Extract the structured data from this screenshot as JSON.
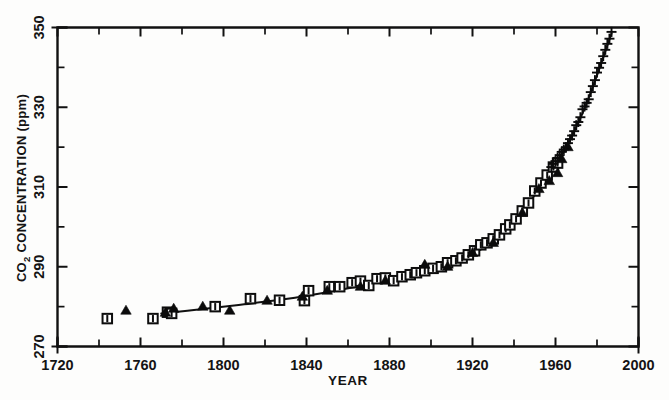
{
  "figure": {
    "background_color": "#fdfdfc",
    "ink_color": "#111111"
  },
  "axes": {
    "x_title": "YEAR",
    "y_title_main": "CO",
    "y_title_sub": "2",
    "y_title_rest": " CONCENTRATION (ppm)",
    "x_tick_labels": [
      "1720",
      "1760",
      "1800",
      "1840",
      "1880",
      "1920",
      "1960",
      "2000"
    ],
    "y_tick_labels": [
      "270",
      "290",
      "310",
      "330",
      "350"
    ]
  },
  "chart_data": {
    "type": "scatter",
    "title": "",
    "xlabel": "YEAR",
    "ylabel": "CO2 CONCENTRATION (ppm)",
    "xlim": [
      1720,
      2000
    ],
    "ylim": [
      270,
      350
    ],
    "x_major_ticks": [
      1720,
      1760,
      1800,
      1840,
      1880,
      1920,
      1960,
      2000
    ],
    "x_minor_ticks": [
      1740,
      1780,
      1820,
      1860,
      1900,
      1940,
      1980
    ],
    "y_major_ticks": [
      270,
      290,
      310,
      330,
      350
    ],
    "y_minor_ticks": [
      280,
      300,
      320,
      340
    ],
    "grid": false,
    "legend": "none",
    "series": [
      {
        "name": "Ice core (open squares with error bars)",
        "marker": "open-square",
        "points": [
          [
            1744,
            277.0
          ],
          [
            1766,
            277.0
          ],
          [
            1773,
            278.6
          ],
          [
            1775,
            278.3
          ],
          [
            1796,
            280.0
          ],
          [
            1813,
            282.0
          ],
          [
            1827,
            281.6
          ],
          [
            1839,
            281.5
          ],
          [
            1841,
            284.0
          ],
          [
            1851,
            285.0
          ],
          [
            1856,
            285.0
          ],
          [
            1862,
            286.0
          ],
          [
            1866,
            286.4
          ],
          [
            1870,
            285.3
          ],
          [
            1874,
            287.0
          ],
          [
            1878,
            287.2
          ],
          [
            1882,
            286.5
          ],
          [
            1886,
            287.5
          ],
          [
            1890,
            288.0
          ],
          [
            1893,
            288.5
          ],
          [
            1897,
            289.0
          ],
          [
            1901,
            289.6
          ],
          [
            1905,
            290.0
          ],
          [
            1908,
            291.0
          ],
          [
            1912,
            291.5
          ],
          [
            1915,
            292.2
          ],
          [
            1918,
            293.0
          ],
          [
            1921,
            294.0
          ],
          [
            1924,
            295.5
          ],
          [
            1927,
            296.0
          ],
          [
            1930,
            297.0
          ],
          [
            1933,
            298.0
          ],
          [
            1936,
            299.5
          ],
          [
            1938,
            300.5
          ],
          [
            1941,
            302.0
          ],
          [
            1944,
            304.0
          ],
          [
            1947,
            306.0
          ],
          [
            1950,
            309.0
          ],
          [
            1953,
            311.0
          ],
          [
            1956,
            313.0
          ],
          [
            1959,
            315.0
          ],
          [
            1961,
            316.0
          ]
        ]
      },
      {
        "name": "Ice core (filled triangles)",
        "marker": "filled-triangle",
        "points": [
          [
            1753,
            279.0
          ],
          [
            1772,
            278.5
          ],
          [
            1776,
            279.5
          ],
          [
            1790,
            280.0
          ],
          [
            1803,
            279.0
          ],
          [
            1821,
            281.5
          ],
          [
            1838,
            282.5
          ],
          [
            1850,
            284.0
          ],
          [
            1866,
            285.0
          ],
          [
            1878,
            286.5
          ],
          [
            1897,
            290.5
          ],
          [
            1908,
            290.0
          ],
          [
            1920,
            293.5
          ],
          [
            1930,
            296.0
          ],
          [
            1944,
            303.5
          ],
          [
            1952,
            309.5
          ],
          [
            1957,
            311.5
          ],
          [
            1961,
            313.5
          ],
          [
            1963,
            317.0
          ],
          [
            1966,
            320.0
          ]
        ]
      },
      {
        "name": "Mauna Loa atmospheric record (plus symbols)",
        "marker": "plus",
        "points": [
          [
            1958,
            315.0
          ],
          [
            1959,
            315.8
          ],
          [
            1960,
            316.5
          ],
          [
            1961,
            317.3
          ],
          [
            1962,
            318.0
          ],
          [
            1963,
            318.8
          ],
          [
            1964,
            319.4
          ],
          [
            1965,
            320.0
          ],
          [
            1966,
            321.0
          ],
          [
            1967,
            322.0
          ],
          [
            1968,
            322.9
          ],
          [
            1969,
            324.0
          ],
          [
            1970,
            325.5
          ],
          [
            1971,
            326.3
          ],
          [
            1972,
            327.5
          ],
          [
            1973,
            329.5
          ],
          [
            1974,
            330.2
          ],
          [
            1975,
            331.1
          ],
          [
            1976,
            332.0
          ],
          [
            1977,
            333.8
          ],
          [
            1978,
            335.3
          ],
          [
            1979,
            336.8
          ],
          [
            1980,
            338.7
          ],
          [
            1981,
            339.9
          ],
          [
            1982,
            341.1
          ],
          [
            1983,
            342.8
          ],
          [
            1984,
            344.4
          ],
          [
            1985,
            345.9
          ],
          [
            1986,
            347.2
          ],
          [
            1987,
            348.9
          ]
        ]
      }
    ],
    "fitted_curve": {
      "name": "Smooth fit through data",
      "points": [
        [
          1770,
          278.3
        ],
        [
          1790,
          279.4
        ],
        [
          1810,
          280.6
        ],
        [
          1830,
          281.9
        ],
        [
          1850,
          283.6
        ],
        [
          1870,
          285.6
        ],
        [
          1890,
          288.0
        ],
        [
          1900,
          289.4
        ],
        [
          1910,
          291.0
        ],
        [
          1920,
          293.2
        ],
        [
          1930,
          296.2
        ],
        [
          1940,
          300.6
        ],
        [
          1950,
          308.0
        ],
        [
          1958,
          314.5
        ],
        [
          1965,
          320.0
        ],
        [
          1970,
          325.0
        ],
        [
          1975,
          331.0
        ],
        [
          1980,
          338.0
        ],
        [
          1985,
          345.5
        ],
        [
          1987,
          348.5
        ]
      ]
    }
  }
}
